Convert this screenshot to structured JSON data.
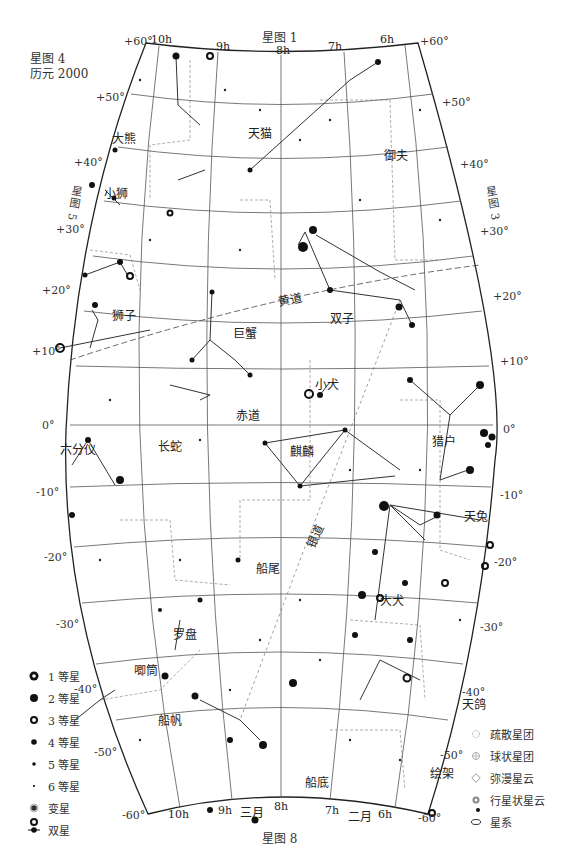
{
  "header": {
    "chart_name": "星图 4",
    "epoch": "历元 2000"
  },
  "neighbors": {
    "top": "星图 1",
    "bottom": "星图 8",
    "left": "星图 5",
    "right": "星图 3"
  },
  "ra_labels_top": [
    "10h",
    "9h",
    "8h",
    "7h",
    "6h"
  ],
  "ra_labels_bottom": [
    "10h",
    "9h",
    "8h",
    "7h",
    "6h"
  ],
  "month_labels_bottom": [
    "三月",
    "二月"
  ],
  "dec_labels_left": [
    "+60°",
    "+50°",
    "+40°",
    "+30°",
    "+20°",
    "+10°",
    "0°",
    "-10°",
    "-20°",
    "-30°",
    "-40°",
    "-50°",
    "-60°"
  ],
  "dec_labels_right": [
    "+60°",
    "+50°",
    "+40°",
    "+30°",
    "+20°",
    "+10°",
    "0°",
    "-10°",
    "-20°",
    "-30°",
    "-40°",
    "-50°",
    "-60°"
  ],
  "special_lines": {
    "ecliptic": "黄道",
    "equator": "赤道",
    "milky_way": "银道"
  },
  "constellations": [
    {
      "name": "天猫",
      "x": 248,
      "y": 130
    },
    {
      "name": "大熊",
      "x": 112,
      "y": 135
    },
    {
      "name": "御夫",
      "x": 384,
      "y": 152
    },
    {
      "name": "小狮",
      "x": 112,
      "y": 190
    },
    {
      "name": "狮子",
      "x": 112,
      "y": 312
    },
    {
      "name": "巨蟹",
      "x": 232,
      "y": 330
    },
    {
      "name": "双子",
      "x": 330,
      "y": 315
    },
    {
      "name": "小犬",
      "x": 315,
      "y": 381
    },
    {
      "name": "赤道",
      "x": 236,
      "y": 413
    },
    {
      "name": "六分仪",
      "x": 64,
      "y": 446
    },
    {
      "name": "长蛇",
      "x": 160,
      "y": 443
    },
    {
      "name": "麒麟",
      "x": 290,
      "y": 448
    },
    {
      "name": "猎户",
      "x": 432,
      "y": 438
    },
    {
      "name": "天兔",
      "x": 464,
      "y": 513
    },
    {
      "name": "船尾",
      "x": 256,
      "y": 565
    },
    {
      "name": "大犬",
      "x": 380,
      "y": 597
    },
    {
      "name": "罗盘",
      "x": 173,
      "y": 631
    },
    {
      "name": "唧筒",
      "x": 135,
      "y": 667
    },
    {
      "name": "天鸽",
      "x": 462,
      "y": 701
    },
    {
      "name": "船帆",
      "x": 158,
      "y": 717
    },
    {
      "name": "船底",
      "x": 305,
      "y": 779
    },
    {
      "name": "绘架",
      "x": 430,
      "y": 770
    }
  ],
  "legend_left": [
    {
      "symbol": "mag1",
      "label": "1 等星"
    },
    {
      "symbol": "mag2",
      "label": "2 等星"
    },
    {
      "symbol": "mag3",
      "label": "3 等星"
    },
    {
      "symbol": "mag4",
      "label": "4 等星"
    },
    {
      "symbol": "mag5",
      "label": "5 等星"
    },
    {
      "symbol": "mag6",
      "label": "6 等星"
    },
    {
      "symbol": "variable",
      "label": "变星"
    },
    {
      "symbol": "double",
      "label": "双星"
    }
  ],
  "legend_right": [
    {
      "symbol": "open-cluster",
      "label": "疏散星团"
    },
    {
      "symbol": "globular-cluster",
      "label": "球状星团"
    },
    {
      "symbol": "diffuse-nebula",
      "label": "弥漫星云"
    },
    {
      "symbol": "planetary-nebula",
      "label": "行星状星云"
    },
    {
      "symbol": "galaxy",
      "label": "星系"
    }
  ],
  "colors": {
    "ink": "#1a1a1a",
    "grid": "#555555",
    "boundary_dash": "#777777",
    "background": "#ffffff"
  }
}
